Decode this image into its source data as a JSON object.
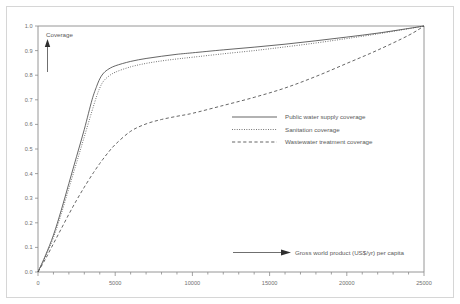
{
  "chart_data": {
    "type": "line",
    "title": "",
    "xlabel": "Gross world product (US$/yr) per capita",
    "ylabel": "Coverage",
    "xlim": [
      0,
      25000
    ],
    "ylim": [
      0.0,
      1.0
    ],
    "grid": false,
    "legend_position": "center-right",
    "x_ticks_major": [
      0,
      5000,
      10000,
      15000,
      20000,
      25000
    ],
    "x_tick_labels": [
      "0",
      "5000",
      "10000",
      "15000",
      "20000",
      "25000"
    ],
    "x_ticks_minor_step": 1000,
    "y_ticks": [
      0.0,
      0.1,
      0.2,
      0.3,
      0.4,
      0.5,
      0.6,
      0.7,
      0.8,
      0.9,
      1.0
    ],
    "y_tick_labels": [
      "0.0",
      "0.1",
      "0.2",
      "0.3",
      "0.4",
      "0.5",
      "0.6",
      "0.7",
      "0.8",
      "0.9",
      "1.0"
    ],
    "x": [
      0,
      500,
      1000,
      1500,
      2000,
      2500,
      3000,
      3500,
      3800,
      4000,
      4200,
      4500,
      5000,
      6000,
      7000,
      8000,
      9000,
      10000,
      12000,
      14000,
      16000,
      18000,
      20000,
      22000,
      24000,
      25000
    ],
    "series": [
      {
        "name": "Public water supply coverage",
        "style": "solid",
        "values": [
          0.0,
          0.07,
          0.15,
          0.25,
          0.36,
          0.47,
          0.58,
          0.7,
          0.755,
          0.785,
          0.805,
          0.822,
          0.838,
          0.856,
          0.868,
          0.877,
          0.885,
          0.891,
          0.903,
          0.914,
          0.926,
          0.94,
          0.955,
          0.971,
          0.99,
          1.0
        ]
      },
      {
        "name": "Sanitation coverage",
        "style": "dotted",
        "values": [
          0.0,
          0.065,
          0.14,
          0.235,
          0.34,
          0.445,
          0.55,
          0.655,
          0.715,
          0.748,
          0.772,
          0.792,
          0.812,
          0.834,
          0.848,
          0.858,
          0.866,
          0.873,
          0.887,
          0.9,
          0.915,
          0.931,
          0.949,
          0.968,
          0.989,
          1.0
        ]
      },
      {
        "name": "Wastewater treatment coverage",
        "style": "dashed",
        "values": [
          0.0,
          0.055,
          0.115,
          0.175,
          0.235,
          0.292,
          0.345,
          0.395,
          0.423,
          0.441,
          0.458,
          0.482,
          0.518,
          0.572,
          0.602,
          0.62,
          0.633,
          0.645,
          0.677,
          0.71,
          0.748,
          0.795,
          0.848,
          0.902,
          0.962,
          1.0
        ]
      }
    ]
  },
  "axes": {
    "y_axis_label": "Coverage",
    "x_axis_label": "Gross world product (US$/yr) per capita"
  },
  "legend": {
    "entries": [
      {
        "label": "Public water supply coverage",
        "style": "solid"
      },
      {
        "label": "Sanitation coverage",
        "style": "dotted"
      },
      {
        "label": "Wastewater treatment coverage",
        "style": "dashed"
      }
    ]
  },
  "colors": {
    "background": "#ffffff",
    "frame": "#d6d6d6",
    "axis": "#8a8a8a",
    "curve": "#4a4a4a",
    "text": "#5a5a5a",
    "tick_text": "#707070"
  }
}
